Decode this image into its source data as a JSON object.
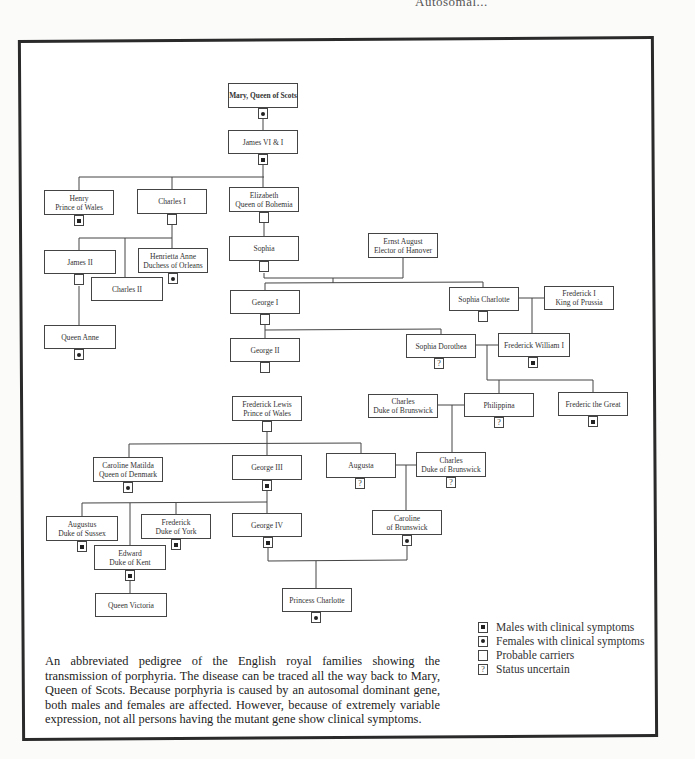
{
  "running_head": "Autosomal...",
  "symbols": {
    "male_affected": "filled-square",
    "female_affected": "filled-circle",
    "carrier": "empty",
    "uncertain": "?"
  },
  "people": {
    "mary": {
      "line1": "Mary, Queen of Scots",
      "line2": "",
      "status": "female_affected"
    },
    "james6": {
      "line1": "James VI & I",
      "line2": "",
      "status": "male_affected"
    },
    "henry": {
      "line1": "Henry",
      "line2": "Prince of Wales",
      "status": "male_affected"
    },
    "charles1": {
      "line1": "Charles I",
      "line2": "",
      "status": "carrier"
    },
    "elizabeth": {
      "line1": "Elizabeth",
      "line2": "Queen of Bohemia",
      "status": "carrier"
    },
    "james2": {
      "line1": "James II",
      "line2": "",
      "status": "carrier"
    },
    "charles2": {
      "line1": "Charles II",
      "line2": "",
      "status": "none"
    },
    "henrietta": {
      "line1": "Henrietta Anne",
      "line2": "Duchess of Orleans",
      "status": "female_affected"
    },
    "sophia": {
      "line1": "Sophia",
      "line2": "",
      "status": "carrier"
    },
    "ernst": {
      "line1": "Ernst August",
      "line2": "Elector of Hanover",
      "status": "none"
    },
    "anne": {
      "line1": "Queen Anne",
      "line2": "",
      "status": "female_affected"
    },
    "george1": {
      "line1": "George I",
      "line2": "",
      "status": "carrier"
    },
    "sophia_charlotte": {
      "line1": "Sophia Charlotte",
      "line2": "",
      "status": "carrier"
    },
    "frederick1": {
      "line1": "Frederick I",
      "line2": "King of Prussia",
      "status": "none"
    },
    "george2": {
      "line1": "George II",
      "line2": "",
      "status": "carrier"
    },
    "sophia_dorothea": {
      "line1": "Sophia Dorothea",
      "line2": "",
      "status": "uncertain"
    },
    "fw1": {
      "line1": "Frederick William I",
      "line2": "",
      "status": "male_affected"
    },
    "frederick_lewis": {
      "line1": "Frederick Lewis",
      "line2": "Prince of Wales",
      "status": "carrier"
    },
    "charles_dob1": {
      "line1": "Charles",
      "line2": "Duke of Brunswick",
      "status": "none"
    },
    "philippina": {
      "line1": "Philippina",
      "line2": "",
      "status": "uncertain"
    },
    "frederic_great": {
      "line1": "Frederic the Great",
      "line2": "",
      "status": "male_affected"
    },
    "caroline_matilda": {
      "line1": "Caroline Matilda",
      "line2": "Queen of Denmark",
      "status": "female_affected"
    },
    "george3": {
      "line1": "George III",
      "line2": "",
      "status": "male_affected"
    },
    "augusta": {
      "line1": "Augusta",
      "line2": "",
      "status": "uncertain"
    },
    "charles_dob2": {
      "line1": "Charles",
      "line2": "Duke of Brunswick",
      "status": "uncertain"
    },
    "augustus": {
      "line1": "Augustus",
      "line2": "Duke of Sussex",
      "status": "male_affected"
    },
    "frederick_york": {
      "line1": "Frederick",
      "line2": "Duke of York",
      "status": "male_affected"
    },
    "george4": {
      "line1": "George IV",
      "line2": "",
      "status": "male_affected"
    },
    "caroline_brunswick": {
      "line1": "Caroline",
      "line2": "of Brunswick",
      "status": "female_affected"
    },
    "edward": {
      "line1": "Edward",
      "line2": "Duke of Kent",
      "status": "male_affected"
    },
    "victoria": {
      "line1": "Queen Victoria",
      "line2": "",
      "status": "none"
    },
    "charlotte": {
      "line1": "Princess Charlotte",
      "line2": "",
      "status": "female_affected"
    }
  },
  "legend": [
    {
      "symbol": "filled-square",
      "label": "Males with clinical symptoms"
    },
    {
      "symbol": "filled-circle",
      "label": "Females with clinical symptoms"
    },
    {
      "symbol": "empty",
      "label": "Probable carriers"
    },
    {
      "symbol": "?",
      "label": "Status uncertain"
    }
  ],
  "caption": "An abbreviated pedigree of the English royal families showing the transmission of porphyria. The disease can be traced all the way back to Mary, Queen of Scots. Because porphyria is caused by an autosomal dominant gene, both males and females are affected. However, because of extremely variable expression, not all persons having the mutant gene show clinical symptoms."
}
